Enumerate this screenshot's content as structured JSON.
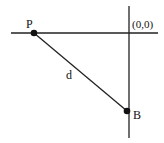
{
  "diagram": {
    "type": "geometry",
    "axes": {
      "horizontal": {
        "x1": 11,
        "y1": 33,
        "x2": 158,
        "y2": 33
      },
      "vertical": {
        "x1": 129,
        "y1": 6,
        "x2": 129,
        "y2": 138
      },
      "origin_label": "(0,0)"
    },
    "points": [
      {
        "id": "P",
        "label": "P",
        "x": 34,
        "y": 33
      },
      {
        "id": "B",
        "label": "B",
        "x": 127,
        "y": 111
      }
    ],
    "segment": {
      "from": "P",
      "to": "B",
      "label": "d"
    },
    "colors": {
      "stroke": "#222222",
      "point": "#111111"
    }
  }
}
